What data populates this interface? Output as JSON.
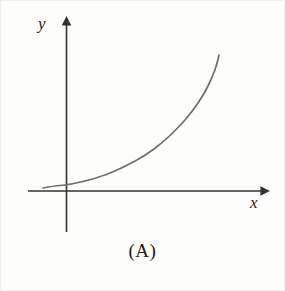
{
  "figure": {
    "caption": "(A)",
    "background_color": "#fdfdfb",
    "axis_color": "#333333",
    "curve_color": "#6e6e6e",
    "label_color": "#1c1c1c"
  },
  "axes": {
    "x_label": "x",
    "y_label": "y",
    "x_axis": {
      "x_start": 28,
      "x_end": 268,
      "y": 191,
      "arrow": "right"
    },
    "y_axis": {
      "x": 66,
      "y_start": 232,
      "y_end": 18,
      "arrow": "up"
    }
  },
  "chart_data": {
    "type": "line",
    "title": "(A)",
    "xlabel": "x",
    "ylabel": "y",
    "grid": false,
    "legend": null,
    "axis_arrows": true,
    "tick_labels": [],
    "xlim": [
      -0.6,
      5.2
    ],
    "ylim": [
      0,
      6.0
    ],
    "series": [
      {
        "name": "exponential-curve",
        "x": [
          -0.6,
          -0.3,
          0.0,
          0.5,
          1.0,
          1.5,
          2.0,
          2.5,
          3.0,
          3.5,
          4.0,
          4.4,
          4.8,
          5.1
        ],
        "y": [
          0.12,
          0.18,
          0.26,
          0.42,
          0.62,
          0.87,
          1.18,
          1.57,
          2.05,
          2.64,
          3.37,
          4.05,
          4.88,
          5.55
        ],
        "pixel_points": [
          [
            43,
            188
          ],
          [
            54,
            186
          ],
          [
            66,
            185
          ],
          [
            86,
            181
          ],
          [
            106,
            175
          ],
          [
            126,
            166
          ],
          [
            146,
            155
          ],
          [
            162,
            143
          ],
          [
            178,
            128
          ],
          [
            192,
            112
          ],
          [
            204,
            94
          ],
          [
            212,
            78
          ],
          [
            217,
            64
          ],
          [
            219,
            55
          ]
        ]
      }
    ]
  }
}
